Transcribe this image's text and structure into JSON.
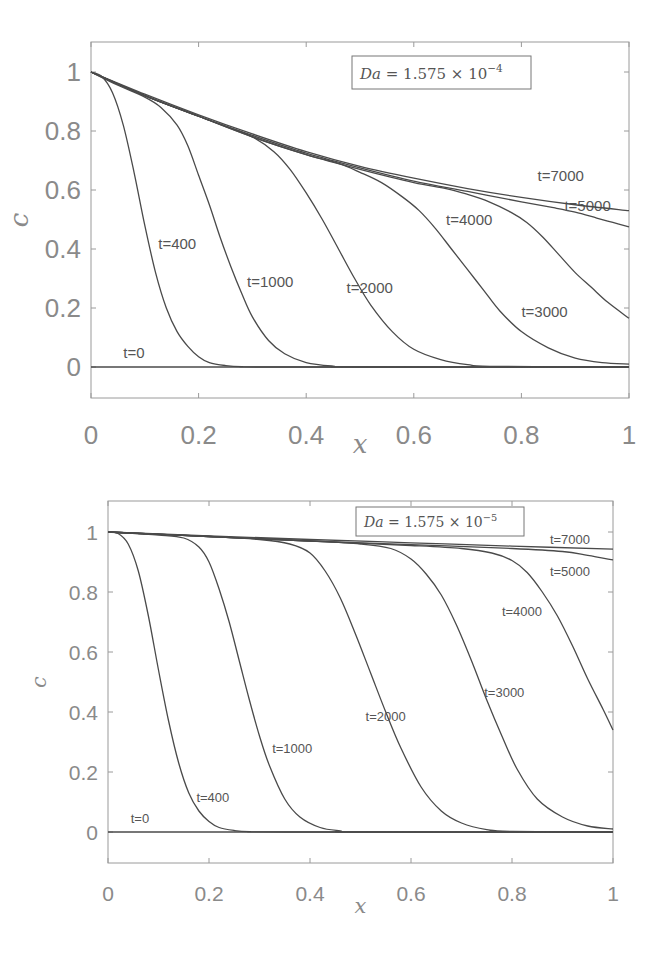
{
  "chart_data": [
    {
      "type": "line",
      "title": "",
      "annotation": "Da = 1.575 × 10^-4",
      "legend": {
        "base": "Da = 1.575 × 10",
        "exponent": "−4"
      },
      "xlabel": "x",
      "ylabel": "c",
      "xlim": [
        0,
        1
      ],
      "ylim": [
        -0.1,
        1.1
      ],
      "xticks": [
        "0",
        "0.2",
        "0.4",
        "0.6",
        "0.8",
        "1"
      ],
      "yticks": [
        "0",
        "0.2",
        "0.4",
        "0.6",
        "0.8",
        "1"
      ],
      "grid": false,
      "series": [
        {
          "name": "t=0",
          "label_pos": [
            0.06,
            0.03
          ],
          "x": [
            0,
            1
          ],
          "values": [
            0,
            0
          ]
        },
        {
          "name": "t=400",
          "label_pos": [
            0.125,
            0.4
          ],
          "x": [
            0,
            0.02,
            0.04,
            0.06,
            0.08,
            0.1,
            0.12,
            0.14,
            0.16,
            0.18,
            0.2,
            0.22,
            0.25,
            0.28,
            0.35,
            1
          ],
          "values": [
            1,
            0.985,
            0.93,
            0.82,
            0.66,
            0.48,
            0.32,
            0.2,
            0.12,
            0.07,
            0.035,
            0.015,
            0.005,
            0.001,
            0,
            0
          ]
        },
        {
          "name": "t=1000",
          "label_pos": [
            0.29,
            0.27
          ],
          "x": [
            0,
            0.05,
            0.1,
            0.13,
            0.16,
            0.18,
            0.2,
            0.22,
            0.24,
            0.26,
            0.28,
            0.3,
            0.33,
            0.36,
            0.4,
            0.45,
            0.5,
            1
          ],
          "values": [
            1,
            0.955,
            0.915,
            0.88,
            0.82,
            0.75,
            0.65,
            0.55,
            0.44,
            0.34,
            0.25,
            0.17,
            0.09,
            0.045,
            0.015,
            0.003,
            0,
            0
          ]
        },
        {
          "name": "t=2000",
          "label_pos": [
            0.475,
            0.25
          ],
          "x": [
            0,
            0.1,
            0.2,
            0.26,
            0.3,
            0.34,
            0.37,
            0.4,
            0.43,
            0.46,
            0.49,
            0.52,
            0.56,
            0.6,
            0.65,
            0.7,
            0.75,
            1
          ],
          "values": [
            1,
            0.92,
            0.85,
            0.81,
            0.78,
            0.73,
            0.67,
            0.59,
            0.5,
            0.4,
            0.3,
            0.21,
            0.12,
            0.06,
            0.025,
            0.008,
            0.002,
            0
          ]
        },
        {
          "name": "t=3000",
          "label_pos": [
            0.8,
            0.17
          ],
          "x": [
            0,
            0.1,
            0.2,
            0.3,
            0.4,
            0.46,
            0.5,
            0.54,
            0.58,
            0.61,
            0.64,
            0.67,
            0.7,
            0.73,
            0.76,
            0.8,
            0.85,
            0.9,
            0.95,
            1
          ],
          "values": [
            1,
            0.92,
            0.85,
            0.78,
            0.72,
            0.69,
            0.66,
            0.625,
            0.575,
            0.53,
            0.47,
            0.4,
            0.33,
            0.26,
            0.19,
            0.12,
            0.065,
            0.03,
            0.015,
            0.01
          ]
        },
        {
          "name": "t=4000",
          "label_pos": [
            0.66,
            0.48
          ],
          "x": [
            0,
            0.1,
            0.2,
            0.3,
            0.4,
            0.5,
            0.6,
            0.66,
            0.7,
            0.74,
            0.78,
            0.81,
            0.84,
            0.87,
            0.9,
            0.93,
            0.96,
            1
          ],
          "values": [
            1,
            0.92,
            0.85,
            0.78,
            0.72,
            0.67,
            0.625,
            0.605,
            0.585,
            0.56,
            0.525,
            0.49,
            0.44,
            0.38,
            0.32,
            0.27,
            0.22,
            0.165
          ]
        },
        {
          "name": "t=5000",
          "label_pos": [
            0.88,
            0.53
          ],
          "x": [
            0,
            0.1,
            0.2,
            0.3,
            0.4,
            0.5,
            0.6,
            0.7,
            0.8,
            0.86,
            0.9,
            0.94,
            0.97,
            1
          ],
          "values": [
            1,
            0.92,
            0.85,
            0.785,
            0.725,
            0.675,
            0.63,
            0.595,
            0.56,
            0.54,
            0.525,
            0.505,
            0.49,
            0.475
          ]
        },
        {
          "name": "t=7000",
          "label_pos": [
            0.83,
            0.63
          ],
          "x": [
            0,
            0.1,
            0.2,
            0.3,
            0.4,
            0.5,
            0.6,
            0.7,
            0.8,
            0.9,
            1
          ],
          "values": [
            1,
            0.925,
            0.855,
            0.79,
            0.73,
            0.68,
            0.64,
            0.605,
            0.575,
            0.55,
            0.53
          ]
        }
      ]
    },
    {
      "type": "line",
      "title": "",
      "annotation": "Da = 1.575 × 10^-5",
      "legend": {
        "base": "Da = 1.575 × 10",
        "exponent": "−5"
      },
      "xlabel": "x",
      "ylabel": "c",
      "xlim": [
        0,
        1
      ],
      "ylim": [
        -0.1,
        1.1
      ],
      "xticks": [
        "0",
        "0.2",
        "0.4",
        "0.6",
        "0.8",
        "1"
      ],
      "yticks": [
        "0",
        "0.2",
        "0.4",
        "0.6",
        "0.8",
        "1"
      ],
      "grid": false,
      "series": [
        {
          "name": "t=0",
          "label_pos": [
            0.045,
            0.03
          ],
          "x": [
            0,
            1
          ],
          "values": [
            0,
            0
          ]
        },
        {
          "name": "t=400",
          "label_pos": [
            0.175,
            0.1
          ],
          "x": [
            0,
            0.02,
            0.04,
            0.06,
            0.08,
            0.1,
            0.12,
            0.14,
            0.16,
            0.18,
            0.2,
            0.22,
            0.25,
            0.28,
            0.35,
            1
          ],
          "values": [
            1,
            0.995,
            0.96,
            0.87,
            0.72,
            0.54,
            0.37,
            0.23,
            0.13,
            0.07,
            0.035,
            0.015,
            0.005,
            0.001,
            0,
            0
          ]
        },
        {
          "name": "t=1000",
          "label_pos": [
            0.325,
            0.265
          ],
          "x": [
            0,
            0.1,
            0.15,
            0.18,
            0.2,
            0.22,
            0.24,
            0.26,
            0.28,
            0.3,
            0.32,
            0.35,
            0.38,
            0.42,
            0.46,
            0.5,
            1
          ],
          "values": [
            1,
            0.99,
            0.98,
            0.95,
            0.9,
            0.81,
            0.7,
            0.57,
            0.44,
            0.32,
            0.22,
            0.11,
            0.05,
            0.015,
            0.004,
            0,
            0
          ]
        },
        {
          "name": "t=2000",
          "label_pos": [
            0.51,
            0.37
          ],
          "x": [
            0,
            0.2,
            0.3,
            0.36,
            0.4,
            0.43,
            0.46,
            0.49,
            0.52,
            0.55,
            0.58,
            0.62,
            0.66,
            0.7,
            0.75,
            0.8,
            1
          ],
          "values": [
            1,
            0.985,
            0.975,
            0.96,
            0.93,
            0.87,
            0.78,
            0.66,
            0.53,
            0.4,
            0.28,
            0.15,
            0.07,
            0.03,
            0.008,
            0.002,
            0
          ]
        },
        {
          "name": "t=3000",
          "label_pos": [
            0.745,
            0.45
          ],
          "x": [
            0,
            0.2,
            0.4,
            0.5,
            0.56,
            0.6,
            0.63,
            0.66,
            0.69,
            0.72,
            0.75,
            0.78,
            0.81,
            0.85,
            0.9,
            0.95,
            1
          ],
          "values": [
            1,
            0.985,
            0.97,
            0.96,
            0.945,
            0.91,
            0.86,
            0.79,
            0.69,
            0.57,
            0.44,
            0.32,
            0.21,
            0.11,
            0.05,
            0.02,
            0.01
          ]
        },
        {
          "name": "t=4000",
          "label_pos": [
            0.78,
            0.72
          ],
          "x": [
            0,
            0.2,
            0.4,
            0.6,
            0.7,
            0.76,
            0.8,
            0.83,
            0.86,
            0.89,
            0.92,
            0.95,
            0.98,
            1
          ],
          "values": [
            1,
            0.985,
            0.97,
            0.955,
            0.945,
            0.93,
            0.905,
            0.865,
            0.8,
            0.72,
            0.62,
            0.51,
            0.41,
            0.34
          ]
        },
        {
          "name": "t=5000",
          "label_pos": [
            0.875,
            0.855
          ],
          "x": [
            0,
            0.2,
            0.4,
            0.6,
            0.8,
            0.9,
            0.95,
            1
          ],
          "values": [
            1,
            0.985,
            0.97,
            0.958,
            0.945,
            0.935,
            0.922,
            0.907
          ]
        },
        {
          "name": "t=7000",
          "label_pos": [
            0.875,
            0.96
          ],
          "x": [
            0,
            0.2,
            0.4,
            0.6,
            0.8,
            1
          ],
          "values": [
            1,
            0.987,
            0.975,
            0.964,
            0.953,
            0.943
          ]
        }
      ]
    }
  ],
  "charts": [
    {
      "id": "top",
      "legend_text": "Da = 1.575 × 10",
      "legend_exp": "−4",
      "xlabel": "x",
      "ylabel": "c"
    },
    {
      "id": "bottom",
      "legend_text": "Da = 1.575 × 10",
      "legend_exp": "−5",
      "xlabel": "x",
      "ylabel": "c"
    }
  ],
  "colors": {
    "curve": "#4a4a4a",
    "axis": "#9a9a9a",
    "tick_text": "#8a8a8a",
    "label_text": "#555555"
  }
}
